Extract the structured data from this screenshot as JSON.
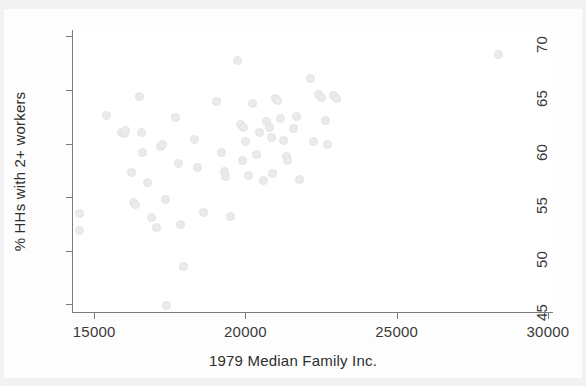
{
  "chart_data": {
    "type": "scatter",
    "title": "",
    "xlabel": "1979 Median Family Inc.",
    "ylabel": "% HHs with 2+ workers",
    "xlim": [
      14300,
      30200
    ],
    "ylim": [
      44.2,
      70.6
    ],
    "xticks": [
      15000,
      20000,
      25000,
      30000
    ],
    "yticks": [
      45,
      50,
      55,
      60,
      65,
      70
    ],
    "xtick_labels": [
      "15000",
      "20000",
      "25000",
      "30000"
    ],
    "ytick_labels": [
      "45",
      "50",
      "55",
      "60",
      "65",
      "70"
    ],
    "grid": false,
    "legend": null,
    "marker": {
      "shape": "circle",
      "color": "#ebebeb",
      "edge_color": "#e3e3e3",
      "size_px": 9
    },
    "n_points": 63,
    "points": [
      {
        "x": 14500,
        "y": 53.5
      },
      {
        "x": 14500,
        "y": 51.9
      },
      {
        "x": 15400,
        "y": 62.6
      },
      {
        "x": 15900,
        "y": 61.0
      },
      {
        "x": 16000,
        "y": 60.9
      },
      {
        "x": 16050,
        "y": 61.2
      },
      {
        "x": 16250,
        "y": 57.3
      },
      {
        "x": 16300,
        "y": 54.5
      },
      {
        "x": 16350,
        "y": 54.3
      },
      {
        "x": 16500,
        "y": 64.4
      },
      {
        "x": 16550,
        "y": 61.0
      },
      {
        "x": 16600,
        "y": 59.2
      },
      {
        "x": 16750,
        "y": 56.4
      },
      {
        "x": 16900,
        "y": 53.1
      },
      {
        "x": 17050,
        "y": 52.2
      },
      {
        "x": 17200,
        "y": 59.7
      },
      {
        "x": 17250,
        "y": 59.9
      },
      {
        "x": 17350,
        "y": 54.8
      },
      {
        "x": 17400,
        "y": 44.9
      },
      {
        "x": 17700,
        "y": 62.4
      },
      {
        "x": 17800,
        "y": 58.1
      },
      {
        "x": 17850,
        "y": 52.5
      },
      {
        "x": 17950,
        "y": 48.5
      },
      {
        "x": 18300,
        "y": 60.4
      },
      {
        "x": 18400,
        "y": 57.8
      },
      {
        "x": 18600,
        "y": 53.6
      },
      {
        "x": 19050,
        "y": 63.9
      },
      {
        "x": 19200,
        "y": 59.2
      },
      {
        "x": 19300,
        "y": 57.4
      },
      {
        "x": 19350,
        "y": 56.9
      },
      {
        "x": 19500,
        "y": 53.2
      },
      {
        "x": 19750,
        "y": 67.8
      },
      {
        "x": 19850,
        "y": 61.8
      },
      {
        "x": 19900,
        "y": 58.4
      },
      {
        "x": 19950,
        "y": 61.5
      },
      {
        "x": 20000,
        "y": 60.2
      },
      {
        "x": 20100,
        "y": 57.0
      },
      {
        "x": 20250,
        "y": 63.7
      },
      {
        "x": 20350,
        "y": 59.0
      },
      {
        "x": 20450,
        "y": 61.0
      },
      {
        "x": 20600,
        "y": 56.6
      },
      {
        "x": 20700,
        "y": 62.1
      },
      {
        "x": 20800,
        "y": 61.5
      },
      {
        "x": 20850,
        "y": 60.6
      },
      {
        "x": 20900,
        "y": 57.2
      },
      {
        "x": 21000,
        "y": 64.2
      },
      {
        "x": 21050,
        "y": 64.0
      },
      {
        "x": 21150,
        "y": 62.3
      },
      {
        "x": 21250,
        "y": 60.3
      },
      {
        "x": 21350,
        "y": 58.8
      },
      {
        "x": 21400,
        "y": 58.4
      },
      {
        "x": 21600,
        "y": 61.4
      },
      {
        "x": 21700,
        "y": 62.5
      },
      {
        "x": 21800,
        "y": 56.7
      },
      {
        "x": 22150,
        "y": 66.1
      },
      {
        "x": 22250,
        "y": 60.2
      },
      {
        "x": 22400,
        "y": 64.6
      },
      {
        "x": 22500,
        "y": 64.3
      },
      {
        "x": 22650,
        "y": 62.2
      },
      {
        "x": 22700,
        "y": 59.9
      },
      {
        "x": 22900,
        "y": 64.5
      },
      {
        "x": 23000,
        "y": 64.2
      },
      {
        "x": 28350,
        "y": 68.3
      }
    ]
  }
}
